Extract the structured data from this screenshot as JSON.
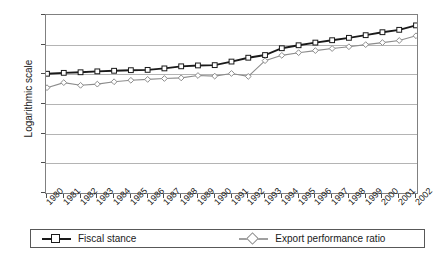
{
  "chart_data": {
    "type": "line",
    "title": "",
    "subtitle": "",
    "xlabel": "",
    "ylabel": "Logarithmic scale",
    "ylim": [
      0,
      6
    ],
    "y_ticks": [
      0,
      1,
      2,
      3,
      4,
      5,
      6
    ],
    "grid": true,
    "legend_position": "bottom",
    "categories": [
      "1980",
      "1981",
      "1982",
      "1983",
      "1984",
      "1985",
      "1986",
      "1987",
      "1988",
      "1989",
      "1990",
      "1991",
      "1992",
      "1993",
      "1994",
      "1995",
      "1996",
      "1997",
      "1998",
      "1999",
      "2000",
      "2001",
      "2002"
    ],
    "series": [
      {
        "name": "Fiscal stance",
        "color": "#1a1a1a",
        "marker": "square",
        "values": [
          4.02,
          4.05,
          4.07,
          4.1,
          4.12,
          4.14,
          4.15,
          4.2,
          4.27,
          4.3,
          4.31,
          4.43,
          4.56,
          4.65,
          4.88,
          4.98,
          5.07,
          5.15,
          5.23,
          5.32,
          5.42,
          5.5,
          5.65
        ]
      },
      {
        "name": "Export performance ratio",
        "color": "#8c8c8c",
        "marker": "diamond",
        "values": [
          3.55,
          3.72,
          3.63,
          3.67,
          3.75,
          3.8,
          3.83,
          3.86,
          3.88,
          3.96,
          3.94,
          4.03,
          3.93,
          4.46,
          4.64,
          4.73,
          4.8,
          4.87,
          4.93,
          5.0,
          5.07,
          5.14,
          5.3
        ]
      }
    ]
  },
  "legend": {
    "entries": [
      {
        "label": "Fiscal stance"
      },
      {
        "label": "Export performance ratio"
      }
    ]
  }
}
